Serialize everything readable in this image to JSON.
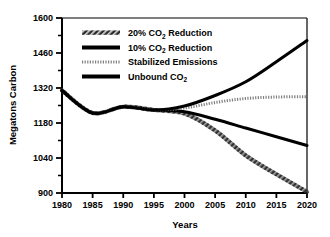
{
  "chart_data": {
    "type": "line",
    "title": "",
    "xlabel": "Years",
    "ylabel": "Megatons Carbon",
    "xlim": [
      1980,
      2020
    ],
    "ylim": [
      900,
      1600
    ],
    "xticks": [
      1980,
      1985,
      1990,
      1995,
      2000,
      2005,
      2010,
      2015,
      2020
    ],
    "yticks": [
      900,
      1040,
      1180,
      1320,
      1460,
      1600
    ],
    "minor_ticks": true,
    "grid": false,
    "legend_position": "upper-left-inside",
    "x": [
      1980,
      1985,
      1990,
      1995,
      2000,
      2005,
      2010,
      2015,
      2020
    ],
    "series": [
      {
        "name": "20% CO2 Reduction",
        "label_main": "20% CO",
        "label_sub": "2",
        "label_tail": " Reduction",
        "style": "hatched",
        "color": "#333333",
        "values": [
          1310,
          1220,
          1245,
          1232,
          1218,
          1150,
          1050,
          975,
          905
        ]
      },
      {
        "name": "10% CO2 Reduction",
        "label_main": "10% CO",
        "label_sub": "2",
        "label_tail": " Reduction",
        "style": "solid-thick",
        "color": "#000000",
        "values": [
          1310,
          1220,
          1245,
          1232,
          1225,
          1195,
          1160,
          1125,
          1090
        ]
      },
      {
        "name": "Stabilized Emissions",
        "label_main": "Stabilized Emissions",
        "label_sub": "",
        "label_tail": "",
        "style": "dotted",
        "color": "#808080",
        "values": [
          1310,
          1220,
          1245,
          1232,
          1240,
          1262,
          1278,
          1284,
          1285
        ]
      },
      {
        "name": "Unbound CO2",
        "label_main": "Unbound CO",
        "label_sub": "2",
        "label_tail": "",
        "style": "solid-thick",
        "color": "#000000",
        "values": [
          1310,
          1220,
          1245,
          1232,
          1248,
          1290,
          1345,
          1425,
          1510
        ]
      }
    ]
  }
}
